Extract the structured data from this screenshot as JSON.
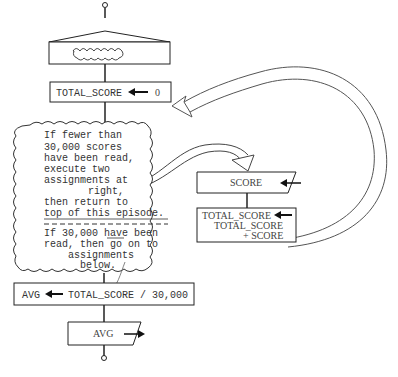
{
  "diagram": {
    "type": "flowchart",
    "episode_header": {
      "symbol": "cloud-squiggle"
    },
    "init_assignment": {
      "target": "TOTAL_SCORE",
      "arrow": "←",
      "value": "0"
    },
    "loop_note": {
      "lines_part1": [
        "If fewer than",
        "30,000 scores",
        "have been read,",
        "execute two",
        "assignments at",
        "right,",
        "then return to",
        "top of this episode."
      ],
      "lines_part2": [
        "If 30,000 have been",
        "read, then go on to",
        "assignments",
        "below."
      ]
    },
    "input_box": {
      "label": "SCORE"
    },
    "accumulate_box": {
      "line1": "TOTAL_SCORE",
      "line2": "TOTAL_SCORE",
      "line3": "+ SCORE"
    },
    "avg_assignment": {
      "target": "AVG",
      "expression": "TOTAL_SCORE / 30,000"
    },
    "output_box": {
      "label": "AVG"
    }
  }
}
